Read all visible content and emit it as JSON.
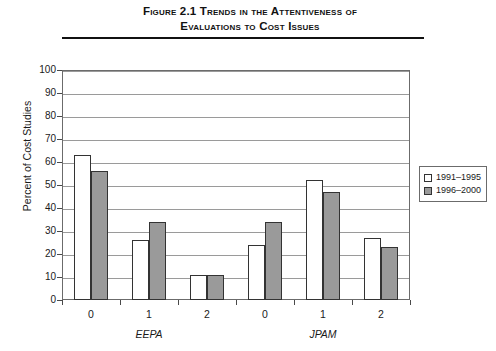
{
  "figure": {
    "title_lines": [
      "Figure 2.1  Trends in the Attentiveness of",
      "Evaluations to Cost Issues"
    ]
  },
  "legend": {
    "position": "right",
    "items": [
      {
        "label": "1991–1995",
        "swatch": "#ffffff"
      },
      {
        "label": "1996–2000",
        "swatch": "#9a9a9a"
      }
    ]
  },
  "groups": [
    {
      "name": "EEPA"
    },
    {
      "name": "JPAM"
    }
  ],
  "chart_data": {
    "type": "bar",
    "title": "Figure 2.1  Trends in the Attentiveness of Evaluations to Cost Issues",
    "xlabel": "",
    "ylabel": "Percent of Cost Studies",
    "ylim": [
      0,
      100
    ],
    "ytick_labels": [
      "0",
      "10",
      "20",
      "30",
      "40",
      "50",
      "60",
      "70",
      "80",
      "90",
      "100"
    ],
    "yticks": [
      0,
      10,
      20,
      30,
      40,
      50,
      60,
      70,
      80,
      90,
      100
    ],
    "grid": true,
    "categories": [
      "0",
      "1",
      "2",
      "0",
      "1",
      "2"
    ],
    "group_labels": [
      "EEPA",
      "EEPA",
      "EEPA",
      "JPAM",
      "JPAM",
      "JPAM"
    ],
    "series": [
      {
        "name": "1991–1995",
        "color": "#ffffff",
        "values": [
          63,
          26,
          11,
          24,
          52,
          27
        ]
      },
      {
        "name": "1996–2000",
        "color": "#9a9a9a",
        "values": [
          56,
          34,
          11,
          34,
          47,
          23
        ]
      }
    ]
  }
}
